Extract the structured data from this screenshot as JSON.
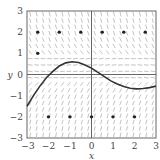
{
  "chart_data": {
    "type": "scatter",
    "title": "",
    "subtitle": "Slope field with solution curve and equilibrium/sample points",
    "xlabel": "x",
    "ylabel": "y",
    "xlim": [
      -3,
      3
    ],
    "ylim": [
      -3,
      3
    ],
    "xticks": [
      -3,
      -2,
      -1,
      0,
      1,
      2,
      3
    ],
    "yticks": [
      -3,
      -2,
      -1,
      0,
      1,
      2,
      3
    ],
    "xtick_labels": [
      "−3",
      "−2",
      "−1",
      "0",
      "1",
      "2",
      "3"
    ],
    "ytick_labels": [
      "−3",
      "−2",
      "−1",
      "0",
      "1",
      "2",
      "3"
    ],
    "grid": false,
    "axes_lines": true,
    "legend": null,
    "slope_field": {
      "x_range": [
        -2.85,
        2.85
      ],
      "y_range": [
        -2.85,
        2.85
      ],
      "spacing": 0.3,
      "segment_length": 0.22,
      "color": "#9a9a9a"
    },
    "series": [
      {
        "name": "solution-curve",
        "type": "line",
        "color": "#333333",
        "x": [
          -3.0,
          -2.7,
          -2.4,
          -2.1,
          -1.8,
          -1.5,
          -1.2,
          -0.9,
          -0.6,
          -0.3,
          0.0,
          0.3,
          0.6,
          0.9,
          1.2,
          1.5,
          1.8,
          2.1,
          2.4,
          2.7,
          3.0
        ],
        "y": [
          -1.5,
          -1.0,
          -0.55,
          -0.15,
          0.15,
          0.4,
          0.55,
          0.6,
          0.57,
          0.45,
          0.3,
          0.1,
          -0.1,
          -0.3,
          -0.45,
          -0.57,
          -0.65,
          -0.68,
          -0.66,
          -0.62,
          -0.55
        ]
      },
      {
        "name": "points",
        "type": "scatter",
        "color": "#222222",
        "x": [
          -2.5,
          -1.5,
          -0.5,
          0.5,
          1.5,
          2.5,
          -2.5,
          -2,
          -1,
          0,
          1,
          2
        ],
        "y": [
          2,
          2,
          2,
          2,
          2,
          2,
          1,
          -2,
          -2,
          -2,
          -2,
          -2
        ]
      }
    ]
  }
}
